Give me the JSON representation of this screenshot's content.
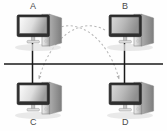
{
  "diagram": {
    "type": "network-topology",
    "background_color": "#fefefe",
    "palette": {
      "bus_line": "#1a1a1a",
      "drop_line": "#1a1a1a",
      "dashed_curve": "#b8b8b8",
      "label_text": "#4a4a4a",
      "monitor_frame": "#2b2b2b",
      "screen_light": "#f2f2f2",
      "screen_dark": "#8d8d8d",
      "tower_light": "#e9e9e9",
      "tower_dark": "#9a9a9a",
      "shadow": "#d9d9d9"
    },
    "nodes": [
      {
        "id": "A",
        "label": "A",
        "label_x": 30,
        "label_y": 2,
        "pc_x": 16,
        "pc_y": 12,
        "label_position": "above"
      },
      {
        "id": "B",
        "label": "B",
        "label_x": 122,
        "label_y": 2,
        "pc_x": 108,
        "pc_y": 12,
        "label_position": "above"
      },
      {
        "id": "C",
        "label": "C",
        "label_x": 30,
        "label_y": 118,
        "pc_x": 16,
        "pc_y": 80,
        "label_position": "below"
      },
      {
        "id": "D",
        "label": "D",
        "label_x": 122,
        "label_y": 118,
        "pc_x": 108,
        "pc_y": 80,
        "label_position": "below"
      }
    ],
    "bus": {
      "name": "shared-bus-line",
      "x1": 4,
      "y1": 64,
      "x2": 163,
      "y2": 64,
      "stroke_width": 1.6
    },
    "drops": [
      {
        "name": "drop-line-a",
        "x": 32.5,
        "y1": 42,
        "y2": 64
      },
      {
        "name": "drop-line-c",
        "x": 32.5,
        "y1": 64,
        "y2": 82
      },
      {
        "name": "drop-line-b",
        "x": 124.5,
        "y1": 42,
        "y2": 64
      },
      {
        "name": "drop-line-d",
        "x": 124.5,
        "y1": 64,
        "y2": 82
      }
    ],
    "flows": [
      {
        "name": "flow-a-to-d",
        "from": "A",
        "to": "D",
        "path": "M 53 30 C 78 16 108 38 119 79",
        "arrow_at": "D",
        "style": "dashed"
      },
      {
        "name": "flow-b-to-c",
        "from": "B",
        "to": "C",
        "path": "M 105 30 C 80 16 50 38 39 79",
        "arrow_at": "C",
        "style": "dashed"
      }
    ],
    "dash_pattern": "2.2 2.4"
  }
}
